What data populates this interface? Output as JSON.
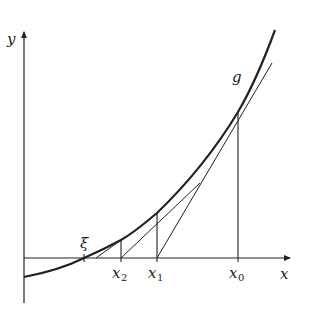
{
  "diagram": {
    "axes": {
      "x_label": "x",
      "y_label": "y"
    },
    "curve_label": "g",
    "root_label": "ξ",
    "points": [
      {
        "name": "x0",
        "base": "x",
        "sub": "0"
      },
      {
        "name": "x1",
        "base": "x",
        "sub": "1"
      },
      {
        "name": "x2",
        "base": "x",
        "sub": "2"
      }
    ],
    "colors": {
      "line": "#222222",
      "background": "#ffffff"
    }
  }
}
